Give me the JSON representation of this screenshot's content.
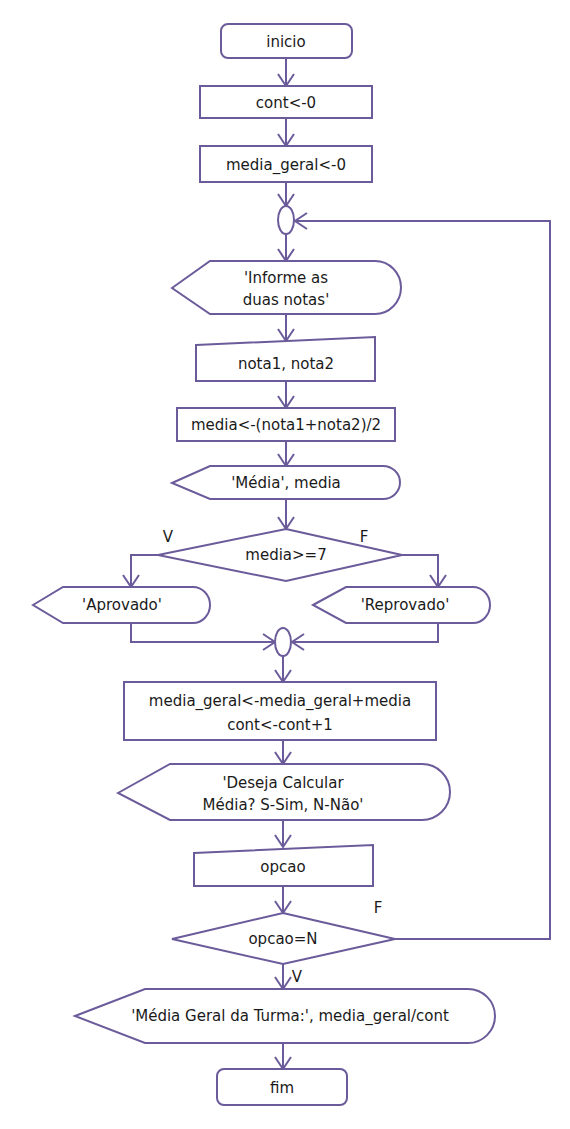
{
  "diagram": {
    "type": "flowchart",
    "nodes": {
      "inicio": {
        "kind": "terminal",
        "text": "inicio"
      },
      "cont_init": {
        "kind": "process",
        "text": "cont<-0"
      },
      "media_geral_init": {
        "kind": "process",
        "text": "media_geral<-0"
      },
      "loop_connector": {
        "kind": "connector",
        "text": ""
      },
      "prompt_notas": {
        "kind": "display",
        "lines": [
          "'Informe as",
          "duas notas'"
        ]
      },
      "input_notas": {
        "kind": "manual-input",
        "text": "nota1, nota2"
      },
      "calc_media": {
        "kind": "process",
        "text": "media<-(nota1+nota2)/2"
      },
      "show_media": {
        "kind": "display",
        "text": "'Média', media"
      },
      "decision_media": {
        "kind": "decision",
        "text": "media>=7",
        "true_label": "V",
        "false_label": "F"
      },
      "aprovado": {
        "kind": "display",
        "text": "'Aprovado'"
      },
      "reprovado": {
        "kind": "display",
        "text": "'Reprovado'"
      },
      "merge_connector": {
        "kind": "connector",
        "text": ""
      },
      "accumulate": {
        "kind": "process",
        "lines": [
          "media_geral<-media_geral+media",
          "cont<-cont+1"
        ]
      },
      "prompt_continuar": {
        "kind": "display",
        "lines": [
          "'Deseja Calcular",
          "Média? S-Sim, N-Não'"
        ]
      },
      "input_opcao": {
        "kind": "manual-input",
        "text": "opcao"
      },
      "decision_opcao": {
        "kind": "decision",
        "text": "opcao=N",
        "true_label": "V",
        "false_label": "F"
      },
      "show_media_geral": {
        "kind": "display",
        "text": "'Média Geral da Turma:', media_geral/cont"
      },
      "fim": {
        "kind": "terminal",
        "text": "fim"
      }
    },
    "edges": [
      {
        "from": "inicio",
        "to": "cont_init"
      },
      {
        "from": "cont_init",
        "to": "media_geral_init"
      },
      {
        "from": "media_geral_init",
        "to": "loop_connector"
      },
      {
        "from": "loop_connector",
        "to": "prompt_notas"
      },
      {
        "from": "prompt_notas",
        "to": "input_notas"
      },
      {
        "from": "input_notas",
        "to": "calc_media"
      },
      {
        "from": "calc_media",
        "to": "show_media"
      },
      {
        "from": "show_media",
        "to": "decision_media"
      },
      {
        "from": "decision_media",
        "to": "aprovado",
        "label": "V"
      },
      {
        "from": "decision_media",
        "to": "reprovado",
        "label": "F"
      },
      {
        "from": "aprovado",
        "to": "merge_connector"
      },
      {
        "from": "reprovado",
        "to": "merge_connector"
      },
      {
        "from": "merge_connector",
        "to": "accumulate"
      },
      {
        "from": "accumulate",
        "to": "prompt_continuar"
      },
      {
        "from": "prompt_continuar",
        "to": "input_opcao"
      },
      {
        "from": "input_opcao",
        "to": "decision_opcao"
      },
      {
        "from": "decision_opcao",
        "to": "loop_connector",
        "label": "F"
      },
      {
        "from": "decision_opcao",
        "to": "show_media_geral",
        "label": "V"
      },
      {
        "from": "show_media_geral",
        "to": "fim"
      }
    ],
    "stroke_color": "#6b5b9a"
  }
}
